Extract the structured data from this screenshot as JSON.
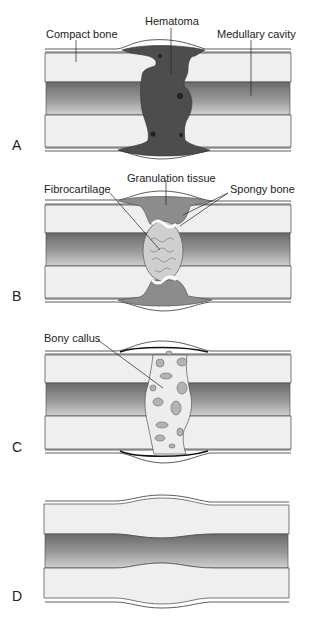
{
  "figure": {
    "colors": {
      "cortex": "#efefef",
      "medullary_dark": "#6e6e6e",
      "medullary_light": "#c9c9c9",
      "hematoma": "#4a4a4a",
      "granulation": "#8a8a8a",
      "fibrocartilage": "#c8c8c8",
      "callus": "#ececec",
      "callus_spots": "#b0b0b0"
    },
    "panels": [
      {
        "id": "A",
        "label": "A",
        "stage": "Hematoma formation",
        "annotations": [
          {
            "text": "Compact bone"
          },
          {
            "text": "Hematoma"
          },
          {
            "text": "Medullary cavity"
          }
        ]
      },
      {
        "id": "B",
        "label": "B",
        "stage": "Fibrocartilaginous callus",
        "annotations": [
          {
            "text": "Fibrocartilage"
          },
          {
            "text": "Granulation tissue"
          },
          {
            "text": "Spongy bone"
          }
        ]
      },
      {
        "id": "C",
        "label": "C",
        "stage": "Bony callus",
        "annotations": [
          {
            "text": "Bony callus"
          }
        ]
      },
      {
        "id": "D",
        "label": "D",
        "stage": "Remodeling",
        "annotations": []
      }
    ]
  }
}
